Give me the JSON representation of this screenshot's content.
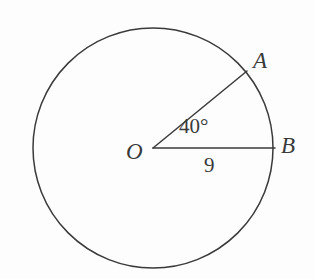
{
  "figure": {
    "type": "circle-sector-diagram",
    "background_color": "#fdfdfd",
    "stroke_color": "#3a3a3a",
    "text_color": "#3a3a3a",
    "stroke_width": 1.5,
    "width": 315,
    "height": 279
  },
  "circle": {
    "center_label": "O",
    "center_x": 153,
    "center_y": 148,
    "radius_px": 120,
    "radius_value": "9"
  },
  "points": {
    "center": "O",
    "arc_point_upper": "A",
    "arc_point_right": "B"
  },
  "labels": {
    "center": "O",
    "point_a": "A",
    "point_b": "B",
    "central_angle": "40°",
    "radius_length": "9"
  },
  "segments": [
    {
      "name": "radius-OA",
      "from": "O",
      "to": "A",
      "x1": 153,
      "y1": 148,
      "x2": 247,
      "y2": 71
    },
    {
      "name": "radius-OB",
      "from": "O",
      "to": "B",
      "x1": 153,
      "y1": 148,
      "x2": 275,
      "y2": 148
    }
  ],
  "measurements": {
    "central_angle_degrees": 40,
    "radius": 9
  }
}
